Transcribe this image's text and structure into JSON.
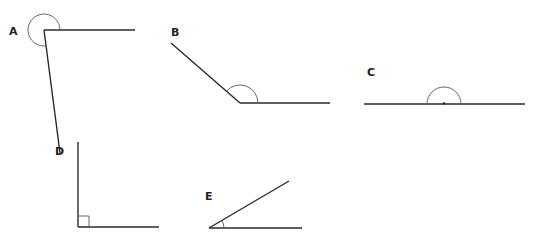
{
  "diagram": {
    "type": "angle-types",
    "angles": [
      {
        "label": "A",
        "kind": "reflex",
        "vertex": [
          44,
          30
        ],
        "arm1_end": [
          135,
          30
        ],
        "arm2_end": [
          60,
          153
        ],
        "arc_radius": 16
      },
      {
        "label": "B",
        "kind": "obtuse",
        "vertex": [
          240,
          103
        ],
        "arm1_end": [
          330,
          103
        ],
        "arm2_end": [
          171,
          43
        ],
        "arc_radius": 18
      },
      {
        "label": "C",
        "kind": "straight",
        "vertex": [
          444,
          104
        ],
        "arm1_end": [
          525,
          104
        ],
        "arm2_end": [
          364,
          104
        ],
        "arc_radius": 17
      },
      {
        "label": "D",
        "kind": "right",
        "vertex": [
          78,
          227
        ],
        "arm1_end": [
          159,
          227
        ],
        "arm2_end": [
          78,
          142
        ],
        "marker_size": 11
      },
      {
        "label": "E",
        "kind": "acute",
        "vertex": [
          209,
          228
        ],
        "arm1_end": [
          302,
          228
        ],
        "arm2_end": [
          289,
          181
        ],
        "arc_radius": 15
      }
    ],
    "colors": {
      "line": "#2a2a2a",
      "arc": "#555555",
      "background": "#ffffff"
    }
  }
}
